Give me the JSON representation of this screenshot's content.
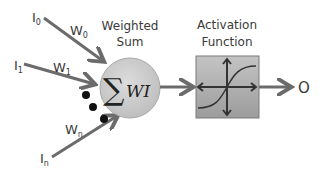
{
  "diagram": {
    "inputs": [
      {
        "label": "I",
        "sub": "0",
        "weight_label": "W",
        "weight_sub": "0"
      },
      {
        "label": "I",
        "sub": "1",
        "weight_label": "W",
        "weight_sub": "1"
      },
      {
        "label": "I",
        "sub": "n",
        "weight_label": "W",
        "weight_sub": "n"
      }
    ],
    "sum_node": {
      "title_line1": "Weighted",
      "title_line2": "Sum",
      "symbol": "∑",
      "formula": "WI"
    },
    "activation": {
      "title_line1": "Activation",
      "title_line2": "Function"
    },
    "output": {
      "label": "O"
    },
    "colors": {
      "arrow": "#6b6b6b",
      "circle_fill": "#c9c9c9",
      "box_fill": "#a9a9a9",
      "text": "#3a3a3a",
      "dots": "#111111"
    }
  }
}
